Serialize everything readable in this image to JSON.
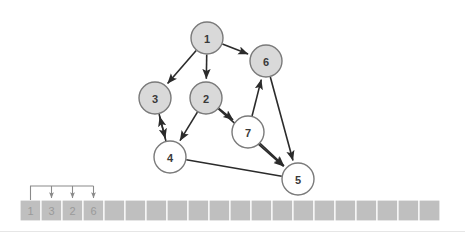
{
  "figure": {
    "title": "",
    "background_color": "#ffffff"
  },
  "graph": {
    "node_fill_filled": "#d9d9d9",
    "node_fill_open": "#ffffff",
    "node_stroke": "#7a7a7a",
    "edge_color": "#2b2b2b",
    "node_radius": 16,
    "nodes": [
      {
        "id": "1",
        "label": "1",
        "cx": 207,
        "cy": 38,
        "style": "filled"
      },
      {
        "id": "6",
        "label": "6",
        "cx": 266,
        "cy": 61,
        "style": "filled"
      },
      {
        "id": "3",
        "label": "3",
        "cx": 155,
        "cy": 98,
        "style": "filled"
      },
      {
        "id": "2",
        "label": "2",
        "cx": 206,
        "cy": 98,
        "style": "filled"
      },
      {
        "id": "7",
        "label": "7",
        "cx": 248,
        "cy": 132,
        "style": "open"
      },
      {
        "id": "4",
        "label": "4",
        "cx": 170,
        "cy": 157,
        "style": "open"
      },
      {
        "id": "5",
        "label": "5",
        "cx": 298,
        "cy": 179,
        "style": "open"
      }
    ],
    "edges": [
      {
        "from": "1",
        "to": "3",
        "directed": true
      },
      {
        "from": "1",
        "to": "2",
        "directed": true
      },
      {
        "from": "1",
        "to": "6",
        "directed": true
      },
      {
        "from": "3",
        "to": "4",
        "directed": true
      },
      {
        "from": "2",
        "to": "4",
        "directed": true
      },
      {
        "from": "4",
        "to": "3",
        "directed": true
      },
      {
        "from": "2",
        "to": "7",
        "directed": true
      },
      {
        "from": "2",
        "to": "5",
        "directed": true
      },
      {
        "from": "4",
        "to": "5",
        "directed": false
      },
      {
        "from": "7",
        "to": "6",
        "directed": true
      },
      {
        "from": "7",
        "to": "5",
        "directed": true
      },
      {
        "from": "6",
        "to": "5",
        "directed": true
      }
    ]
  },
  "array": {
    "cell_fill": "#bfbfbf",
    "cell_border": "#ffffff",
    "text_color": "#9a9a9a",
    "x": 20,
    "y": 200,
    "cell_width": 21,
    "cell_height": 21,
    "cell_count": 20,
    "values": [
      "1",
      "3",
      "2",
      "6",
      "",
      "",
      "",
      "",
      "",
      "",
      "",
      "",
      "",
      "",
      "",
      "",
      "",
      "",
      "",
      ""
    ]
  },
  "bracket": {
    "color": "#8a8a8a",
    "source_cell_index": 0,
    "target_cell_indices": [
      1,
      2,
      3
    ],
    "top_y": 186,
    "tail_y": 200
  }
}
